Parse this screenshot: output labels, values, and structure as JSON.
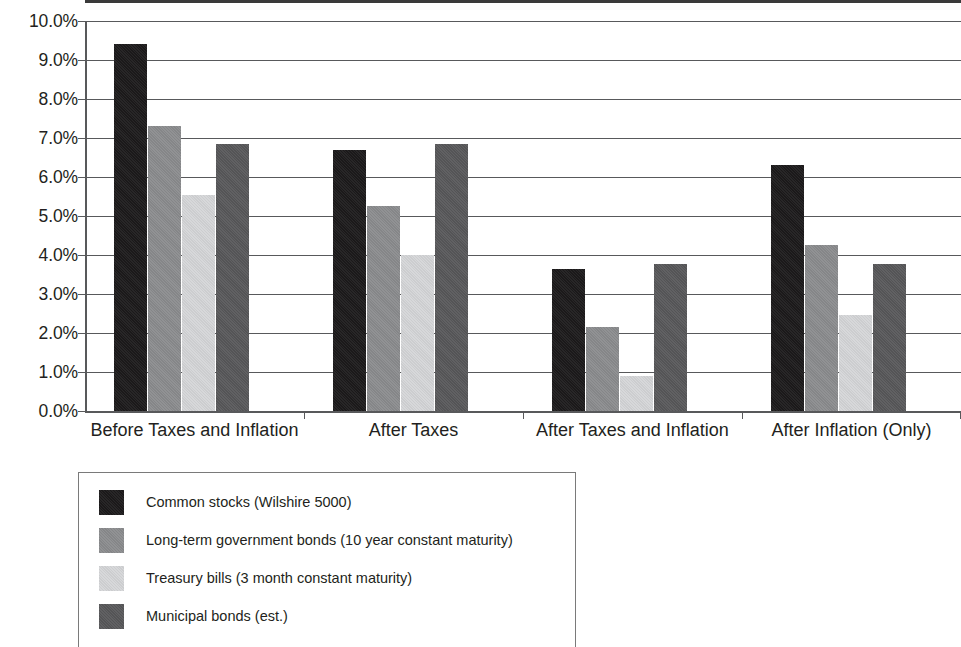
{
  "chart_data": {
    "type": "bar",
    "title": "",
    "xlabel": "",
    "ylabel": "",
    "ylim": [
      0,
      10
    ],
    "ytick_labels": [
      "10.0%",
      "9.0%",
      "8.0%",
      "7.0%",
      "6.0%",
      "5.0%",
      "4.0%",
      "3.0%",
      "2.0%",
      "1.0%",
      "0.0%"
    ],
    "ytick_values": [
      10,
      9,
      8,
      7,
      6,
      5,
      4,
      3,
      2,
      1,
      0
    ],
    "grid": true,
    "legend_position": "below-left",
    "categories": [
      "Before Taxes and Inflation",
      "After Taxes",
      "After Taxes and Inflation",
      "After Inflation (Only)"
    ],
    "series": [
      {
        "name": "Common stocks (Wilshire 5000)",
        "color": "#1c1a1b",
        "values": [
          9.4,
          6.7,
          3.65,
          6.3
        ]
      },
      {
        "name": "Long-term government bonds (10 year constant maturity)",
        "color": "#8b8c8e",
        "values": [
          7.3,
          5.25,
          2.15,
          4.25
        ]
      },
      {
        "name": "Treasury bills (3 month constant maturity)",
        "color": "#d5d6d8",
        "values": [
          5.55,
          4.0,
          0.9,
          2.45
        ]
      },
      {
        "name": "Municipal bonds (est.)",
        "color": "#58585a",
        "values": [
          6.85,
          6.85,
          3.78,
          3.77
        ]
      }
    ]
  },
  "legend": {
    "items": [
      {
        "label": "Common stocks (Wilshire 5000)",
        "swatch_class": "sw-stocks"
      },
      {
        "label": "Long-term government bonds (10 year constant maturity)",
        "swatch_class": "sw-ltbonds"
      },
      {
        "label": "Treasury bills (3 month constant maturity)",
        "swatch_class": "sw-tbills"
      },
      {
        "label": "Municipal bonds (est.)",
        "swatch_class": "sw-muni"
      }
    ]
  }
}
